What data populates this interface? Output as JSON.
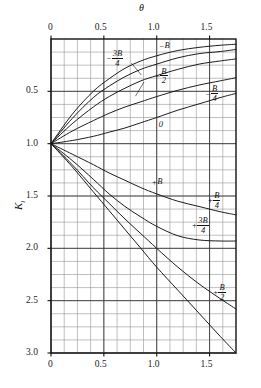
{
  "chart_data": {
    "type": "line",
    "title": "",
    "xlabel": "θ",
    "ylabel": "K",
    "ylabel_sub": "l",
    "xlim": [
      0,
      1.75
    ],
    "ylim": [
      0,
      3.0
    ],
    "y_inverted": true,
    "grid": true,
    "grid_minor_x": 0.125,
    "grid_minor_y": 0.125,
    "xticks": [
      0,
      0.5,
      1.0,
      1.5
    ],
    "xtick_labels": [
      "0",
      "0.5",
      "1.0",
      "1.5"
    ],
    "yticks": [
      0.5,
      1.0,
      1.5,
      2.0,
      2.5,
      3.0
    ],
    "ytick_labels": [
      "0.5",
      "1.0",
      "1.5",
      "2.0",
      "2.5",
      "3.0"
    ],
    "xaxis_position": "both",
    "legend": "inline-annotations",
    "convergence_point": {
      "x": 0,
      "y": 1.0
    },
    "series": [
      {
        "name": "-B",
        "label_sign": "−",
        "label_body": "B",
        "label_num": "",
        "label_den": "",
        "points": [
          [
            0,
            1.0
          ],
          [
            0.2,
            0.72
          ],
          [
            0.4,
            0.5
          ],
          [
            0.55,
            0.38
          ],
          [
            0.7,
            0.28
          ],
          [
            0.85,
            0.21
          ],
          [
            1.0,
            0.16
          ],
          [
            1.2,
            0.11
          ],
          [
            1.4,
            0.08
          ],
          [
            1.6,
            0.06
          ],
          [
            1.75,
            0.05
          ]
        ]
      },
      {
        "name": "-3B/4",
        "label_sign": "−",
        "label_body": "",
        "label_num": "3B",
        "label_den": "4",
        "points": [
          [
            0,
            1.0
          ],
          [
            0.2,
            0.76
          ],
          [
            0.4,
            0.56
          ],
          [
            0.55,
            0.45
          ],
          [
            0.7,
            0.36
          ],
          [
            0.85,
            0.29
          ],
          [
            1.0,
            0.24
          ],
          [
            1.2,
            0.18
          ],
          [
            1.4,
            0.14
          ],
          [
            1.6,
            0.12
          ],
          [
            1.75,
            0.1
          ]
        ]
      },
      {
        "name": "-B/2",
        "label_sign": "−",
        "label_body": "",
        "label_num": "B",
        "label_den": "2",
        "points": [
          [
            0,
            1.0
          ],
          [
            0.2,
            0.81
          ],
          [
            0.4,
            0.65
          ],
          [
            0.55,
            0.55
          ],
          [
            0.7,
            0.47
          ],
          [
            0.85,
            0.4
          ],
          [
            1.0,
            0.35
          ],
          [
            1.2,
            0.29
          ],
          [
            1.4,
            0.24
          ],
          [
            1.6,
            0.21
          ],
          [
            1.75,
            0.19
          ]
        ]
      },
      {
        "name": "-B/4",
        "label_sign": "−",
        "label_body": "",
        "label_num": "B",
        "label_den": "4",
        "points": [
          [
            0,
            1.0
          ],
          [
            0.2,
            0.88
          ],
          [
            0.4,
            0.78
          ],
          [
            0.55,
            0.71
          ],
          [
            0.7,
            0.65
          ],
          [
            0.85,
            0.6
          ],
          [
            1.0,
            0.55
          ],
          [
            1.2,
            0.49
          ],
          [
            1.4,
            0.44
          ],
          [
            1.6,
            0.4
          ],
          [
            1.75,
            0.37
          ]
        ]
      },
      {
        "name": "0",
        "label_sign": "",
        "label_body": "0",
        "label_num": "",
        "label_den": "",
        "points": [
          [
            0,
            1.0
          ],
          [
            0.2,
            0.97
          ],
          [
            0.4,
            0.93
          ],
          [
            0.55,
            0.89
          ],
          [
            0.7,
            0.85
          ],
          [
            0.85,
            0.8
          ],
          [
            1.0,
            0.75
          ],
          [
            1.2,
            0.68
          ],
          [
            1.4,
            0.62
          ],
          [
            1.6,
            0.56
          ],
          [
            1.75,
            0.52
          ]
        ]
      },
      {
        "name": "+B/4",
        "label_sign": "+",
        "label_body": "",
        "label_num": "B",
        "label_den": "4",
        "points": [
          [
            0,
            1.0
          ],
          [
            0.2,
            1.1
          ],
          [
            0.4,
            1.2
          ],
          [
            0.55,
            1.28
          ],
          [
            0.7,
            1.35
          ],
          [
            0.85,
            1.42
          ],
          [
            1.0,
            1.48
          ],
          [
            1.2,
            1.55
          ],
          [
            1.4,
            1.6
          ],
          [
            1.6,
            1.65
          ],
          [
            1.75,
            1.68
          ]
        ]
      },
      {
        "name": "+3B/4",
        "label_sign": "+",
        "label_body": "",
        "label_num": "3B",
        "label_den": "4",
        "points": [
          [
            0,
            1.0
          ],
          [
            0.2,
            1.16
          ],
          [
            0.4,
            1.34
          ],
          [
            0.55,
            1.48
          ],
          [
            0.7,
            1.6
          ],
          [
            0.85,
            1.7
          ],
          [
            1.0,
            1.79
          ],
          [
            1.2,
            1.88
          ],
          [
            1.4,
            1.92
          ],
          [
            1.6,
            1.93
          ],
          [
            1.75,
            1.93
          ]
        ]
      },
      {
        "name": "+B",
        "label_sign": "+",
        "label_body": "B",
        "label_num": "",
        "label_den": "",
        "points": [
          [
            0,
            1.0
          ],
          [
            0.2,
            1.2
          ],
          [
            0.4,
            1.42
          ],
          [
            0.55,
            1.57
          ],
          [
            0.7,
            1.72
          ],
          [
            0.85,
            1.86
          ],
          [
            1.0,
            2.0
          ],
          [
            1.2,
            2.18
          ],
          [
            1.4,
            2.34
          ],
          [
            1.6,
            2.48
          ],
          [
            1.75,
            2.58
          ]
        ]
      },
      {
        "name": "+B/2",
        "label_sign": "+",
        "label_body": "",
        "label_num": "B",
        "label_den": "2",
        "points": [
          [
            0,
            1.0
          ],
          [
            0.2,
            1.22
          ],
          [
            0.4,
            1.46
          ],
          [
            0.55,
            1.64
          ],
          [
            0.7,
            1.82
          ],
          [
            0.85,
            2.0
          ],
          [
            1.0,
            2.18
          ],
          [
            1.2,
            2.4
          ],
          [
            1.4,
            2.62
          ],
          [
            1.6,
            2.84
          ],
          [
            1.75,
            3.0
          ]
        ]
      }
    ],
    "annotations": [
      {
        "id": "ann-minus-B",
        "text": "−B",
        "x": 1.02,
        "y": 0.09
      },
      {
        "id": "ann-minus-3B-4",
        "text": "−3B/4",
        "x": 0.52,
        "y": 0.16
      },
      {
        "id": "ann-minus-B-2",
        "text": "−B/2",
        "x": 0.98,
        "y": 0.33
      },
      {
        "id": "ann-minus-B-4",
        "text": "−B/4",
        "x": 1.46,
        "y": 0.5
      },
      {
        "id": "ann-zero",
        "text": "0",
        "x": 1.02,
        "y": 0.84
      },
      {
        "id": "ann-plus-B",
        "text": "+B",
        "x": 0.95,
        "y": 1.39
      },
      {
        "id": "ann-plus-B-4",
        "text": "+B/4",
        "x": 1.48,
        "y": 1.52
      },
      {
        "id": "ann-plus-3B-4",
        "text": "+3B/4",
        "x": 1.33,
        "y": 1.76
      },
      {
        "id": "ann-plus-B-2",
        "text": "+B/2",
        "x": 1.53,
        "y": 2.4
      }
    ]
  }
}
